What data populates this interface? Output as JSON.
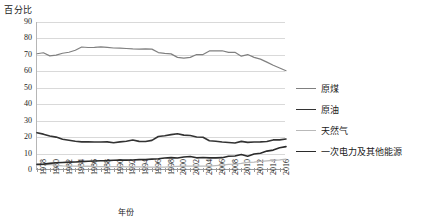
{
  "chart_data": {
    "type": "line",
    "title": "",
    "xlabel": "年份",
    "ylabel": "百分比",
    "ylim": [
      0,
      90
    ],
    "yticks": [
      0,
      10,
      20,
      30,
      40,
      50,
      60,
      70,
      80,
      90
    ],
    "grid": true,
    "legend_position": "right",
    "x": [
      1978,
      1979,
      1980,
      1981,
      1982,
      1983,
      1984,
      1985,
      1986,
      1987,
      1988,
      1989,
      1990,
      1991,
      1992,
      1993,
      1994,
      1995,
      1996,
      1997,
      1998,
      1999,
      2000,
      2001,
      2002,
      2003,
      2004,
      2005,
      2006,
      2007,
      2008,
      2009,
      2010,
      2011,
      2012,
      2013,
      2014,
      2015,
      2016,
      2017
    ],
    "xtick_labels": [
      "1978",
      "1980",
      "1982",
      "1984",
      "1986",
      "1988",
      "1990",
      "1992",
      "1994",
      "1996",
      "1998",
      "2000",
      "2002",
      "2004",
      "2006",
      "2008",
      "2010",
      "2012",
      "2014",
      "2016"
    ],
    "series": [
      {
        "name": "原煤",
        "color": "#808080",
        "width": 1.2,
        "values": [
          70.7,
          71.3,
          69.4,
          69.9,
          71.0,
          71.6,
          72.8,
          74.8,
          74.5,
          74.6,
          74.9,
          74.6,
          74.2,
          74.1,
          73.9,
          73.6,
          73.5,
          73.7,
          73.5,
          71.4,
          70.9,
          70.6,
          68.5,
          68.0,
          68.5,
          70.2,
          70.2,
          72.4,
          72.4,
          72.5,
          71.5,
          71.6,
          69.2,
          70.2,
          68.5,
          67.4,
          65.6,
          63.7,
          62.0,
          60.4
        ]
      },
      {
        "name": "原油",
        "color": "#333333",
        "width": 1.6,
        "values": [
          22.7,
          21.8,
          20.7,
          20.0,
          18.7,
          18.1,
          17.5,
          17.1,
          17.2,
          17.0,
          17.0,
          17.1,
          16.6,
          17.1,
          17.5,
          18.2,
          17.4,
          17.3,
          18.0,
          20.4,
          20.8,
          21.5,
          22.0,
          21.2,
          21.0,
          20.1,
          19.9,
          17.8,
          17.5,
          17.0,
          16.7,
          16.4,
          17.4,
          16.8,
          17.0,
          17.1,
          17.3,
          18.3,
          18.3,
          18.8
        ]
      },
      {
        "name": "天然气",
        "color": "#b9b9b9",
        "width": 1.2,
        "values": [
          3.2,
          3.3,
          3.4,
          2.8,
          2.5,
          2.4,
          2.4,
          2.2,
          2.3,
          2.1,
          2.1,
          2.0,
          2.1,
          2.0,
          1.9,
          1.9,
          1.9,
          1.8,
          1.8,
          1.7,
          1.8,
          2.0,
          2.2,
          2.4,
          2.3,
          2.3,
          2.3,
          2.4,
          2.7,
          3.0,
          3.4,
          3.5,
          4.0,
          4.6,
          4.8,
          5.3,
          5.6,
          5.9,
          6.2,
          6.6
        ]
      },
      {
        "name": "一次电力及其他能源",
        "color": "#2b2b2b",
        "width": 1.6,
        "values": [
          3.4,
          3.6,
          4.0,
          4.4,
          4.6,
          4.8,
          4.9,
          5.1,
          5.3,
          5.5,
          5.6,
          5.7,
          5.9,
          6.0,
          6.0,
          6.1,
          6.3,
          6.4,
          6.6,
          6.8,
          7.3,
          7.5,
          7.3,
          7.9,
          8.2,
          7.4,
          7.6,
          7.4,
          7.4,
          7.5,
          8.4,
          8.5,
          9.4,
          8.4,
          9.7,
          10.2,
          11.5,
          12.1,
          13.5,
          14.2
        ]
      }
    ]
  }
}
